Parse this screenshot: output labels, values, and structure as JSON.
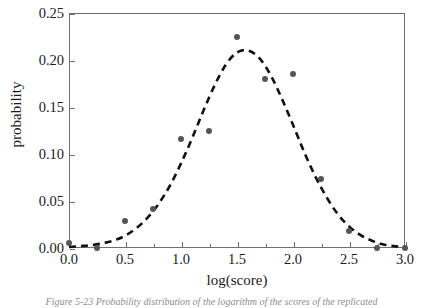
{
  "chart_data": {
    "type": "scatter",
    "title": "",
    "xlabel": "log(score)",
    "ylabel": "probability",
    "xlim": [
      0.0,
      3.0
    ],
    "ylim": [
      0.0,
      0.25
    ],
    "grid": false,
    "legend": null,
    "xticks": [
      "0.0",
      "0.5",
      "1.0",
      "1.5",
      "2.0",
      "2.5",
      "3.0"
    ],
    "xtick_values": [
      0.0,
      0.5,
      1.0,
      1.5,
      2.0,
      2.5,
      3.0
    ],
    "yticks": [
      "0.00",
      "0.05",
      "0.10",
      "0.15",
      "0.20",
      "0.25"
    ],
    "ytick_values": [
      0.0,
      0.05,
      0.1,
      0.15,
      0.2,
      0.25
    ],
    "minor_xtick_values": [
      0.25,
      0.75,
      1.25,
      1.75,
      2.25,
      2.75
    ],
    "series": [
      {
        "name": "observed probability",
        "type": "scatter",
        "marker": "circle",
        "color": "#555555",
        "x": [
          0.0,
          0.25,
          0.5,
          0.75,
          1.0,
          1.25,
          1.5,
          1.75,
          2.0,
          2.25,
          2.5,
          2.75,
          3.0
        ],
        "values": [
          0.005,
          0.0,
          0.029,
          0.042,
          0.116,
          0.125,
          0.225,
          0.18,
          0.185,
          0.073,
          0.018,
          0.0,
          0.0
        ]
      },
      {
        "name": "fitted normal curve",
        "type": "line",
        "linestyle": "dashed",
        "color": "#111111",
        "x": [
          0.0,
          0.1,
          0.2,
          0.3,
          0.4,
          0.5,
          0.6,
          0.7,
          0.8,
          0.9,
          1.0,
          1.1,
          1.2,
          1.3,
          1.4,
          1.5,
          1.6,
          1.7,
          1.8,
          1.9,
          2.0,
          2.1,
          2.2,
          2.3,
          2.4,
          2.5,
          2.6,
          2.7,
          2.8,
          2.9,
          3.0
        ],
        "values": [
          0.001,
          0.002,
          0.003,
          0.005,
          0.008,
          0.013,
          0.021,
          0.032,
          0.047,
          0.066,
          0.09,
          0.117,
          0.146,
          0.173,
          0.195,
          0.208,
          0.21,
          0.202,
          0.184,
          0.159,
          0.131,
          0.102,
          0.076,
          0.054,
          0.036,
          0.023,
          0.014,
          0.008,
          0.004,
          0.002,
          0.001
        ]
      }
    ]
  },
  "caption": {
    "text": "Figure 5-23   Probability distribution of the logarithm of the scores of the replicated"
  },
  "colors": {
    "marker": "#555555",
    "curve": "#111111",
    "axis": "#6f6f6f",
    "background": "#ffffff"
  }
}
